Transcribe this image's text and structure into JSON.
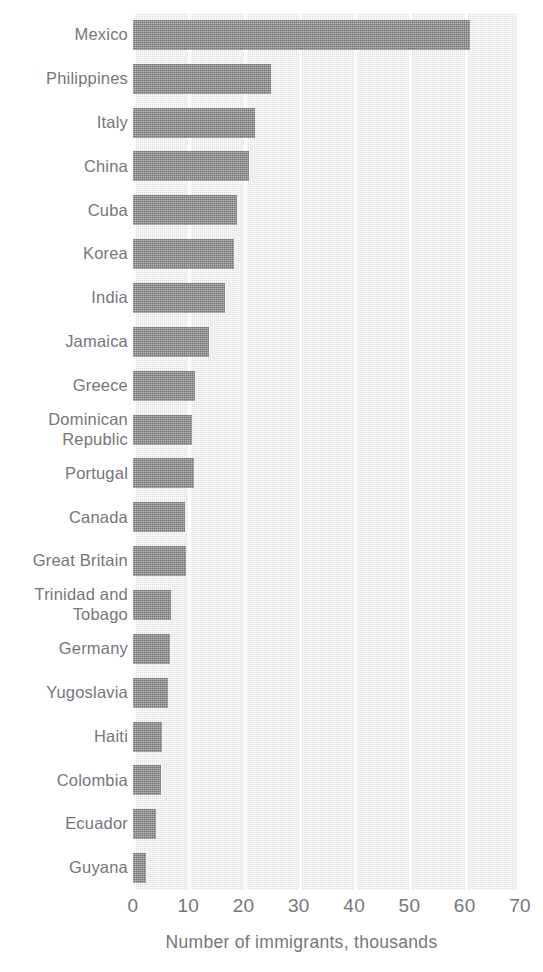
{
  "chart_data": {
    "type": "bar",
    "orientation": "horizontal",
    "title": "",
    "xlabel": "Number of immigrants, thousands",
    "ylabel": "",
    "xlim": [
      0,
      70
    ],
    "xticks": [
      0,
      10,
      20,
      30,
      40,
      50,
      60,
      70
    ],
    "xtick_labels": [
      "0",
      "10",
      "20",
      "30",
      "40",
      "50",
      "60",
      "70"
    ],
    "grid": "vertical-white-gridlines",
    "legend": "none",
    "bar_color": "#8c8c8c",
    "plot_background": "#e4e4e4",
    "gridline_color": "#fdfdfd",
    "text_color": "#76767a",
    "categories": [
      "Mexico",
      "Philippines",
      "Italy",
      "China",
      "Cuba",
      "Korea",
      "India",
      "Jamaica",
      "Greece",
      "Dominican\nRepublic",
      "Portugal",
      "Canada",
      "Great Britain",
      "Trinidad and\nTobago",
      "Germany",
      "Yugoslavia",
      "Haiti",
      "Colombia",
      "Ecuador",
      "Guyana"
    ],
    "values": [
      61.0,
      25.0,
      22.0,
      21.0,
      18.8,
      18.2,
      16.6,
      13.8,
      11.2,
      10.6,
      11.0,
      9.4,
      9.6,
      6.9,
      6.7,
      6.3,
      5.2,
      5.0,
      4.1,
      2.4
    ]
  }
}
